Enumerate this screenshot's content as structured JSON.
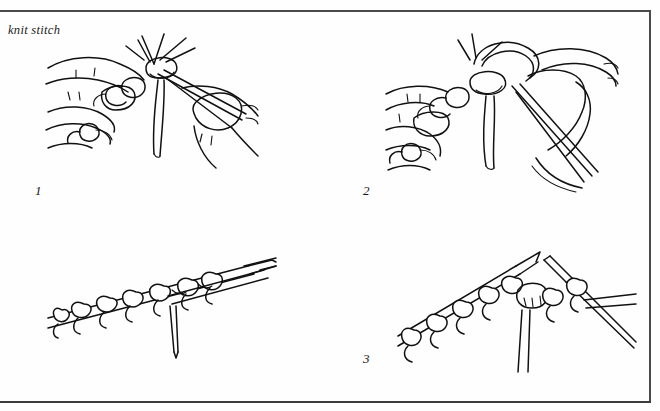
{
  "page": {
    "caption": "knit stitch",
    "background_color": "#fefefe",
    "ink_color": "#111111",
    "frame": {
      "rule_color": "#4a4a4a",
      "has_top_rule": true,
      "has_right_rule": true,
      "has_bottom_rule": true,
      "has_left_rule": false
    }
  },
  "steps": [
    {
      "number": "1",
      "position": "top-left",
      "illustration": "hands-holding-two-knitting-needles-with-yarn-loops"
    },
    {
      "number": "2",
      "position": "top-right",
      "illustration": "hand-wrapping-yarn-around-right-needle"
    },
    {
      "number": "3",
      "position": "bottom-right",
      "illustration": "two-needles-drawing-new-loop-through-stitch"
    }
  ],
  "figures": [
    {
      "name": "figure-step-1",
      "description": "line drawing of two hands holding knitting needles inserting right needle into a stitch"
    },
    {
      "name": "figure-step-2",
      "description": "line drawing of left hand and right needle with yarn wrapped counterclockwise around needle tip"
    },
    {
      "name": "figure-unnumbered-detail",
      "description": "line drawing detail of needle holding a row of chain stitches with yarn tail hanging"
    },
    {
      "name": "figure-step-3",
      "description": "line drawing of both needles crossed, new loop pulled through row of stitches"
    }
  ]
}
